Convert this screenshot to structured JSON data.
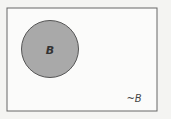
{
  "diagram": {
    "type": "venn",
    "universe_label": "~B",
    "set": {
      "label": "B",
      "fill": "#a9a9a9"
    },
    "colors": {
      "background": "#f4f4f2",
      "universe_fill": "#fbfbfa",
      "stroke": "#555555"
    }
  }
}
